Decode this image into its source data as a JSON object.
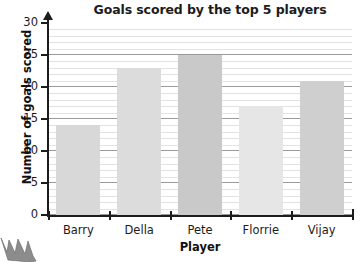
{
  "chart_data": {
    "type": "bar",
    "title": "Goals scored by the top 5 players",
    "xlabel": "Player",
    "ylabel": "Number of goals scored",
    "categories": [
      "Barry",
      "Della",
      "Pete",
      "Florrie",
      "Vijay"
    ],
    "values": [
      14,
      23,
      25,
      17,
      21
    ],
    "ylim": [
      0,
      30
    ],
    "ytick_labels": [
      "0",
      "5",
      "10",
      "15",
      "20",
      "25",
      "30"
    ],
    "ytick_values": [
      0,
      5,
      10,
      15,
      20,
      25,
      30
    ],
    "y_major_step": 5,
    "y_minor_step": 1,
    "grid": true,
    "grid_orientation": "horizontal",
    "legend": "none",
    "bar_colors": [
      "#d8d8d8",
      "#dcdcdc",
      "#c9c9c9",
      "#e6e6e6",
      "#cfcfcf"
    ],
    "bar_count": 5
  },
  "decoration": {
    "crown_icon": "crown-icon"
  }
}
